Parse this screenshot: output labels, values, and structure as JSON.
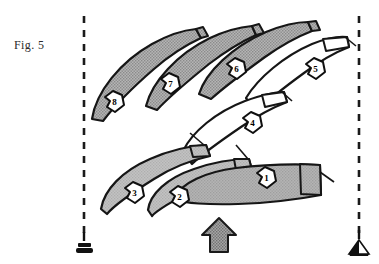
{
  "figure": {
    "label": "Fig. 5",
    "caption_position": "left"
  },
  "canvas": {
    "width": 379,
    "height": 264,
    "background_color": "#ffffff"
  },
  "colors": {
    "ink": "#1a1a1a",
    "hull_hatched_gray": "#9a9a9a",
    "hull_light_gray": "#b8b8b8",
    "hull_medium_gray": "#a8a8a8",
    "hull_white": "#ffffff",
    "arrow_gray": "#8c8c8c",
    "marker_black": "#111111"
  },
  "start_line": {
    "left_limit": {
      "name": "committee-boat-marker",
      "shape": "post-with-black-block",
      "x": 84,
      "y": 244
    },
    "right_limit": {
      "name": "pin-flag-marker",
      "shape": "post-with-half-filled-triangle",
      "x": 359,
      "y": 244
    },
    "left_layline": {
      "x": 84,
      "y_top": 16,
      "y_bottom": 234,
      "style": "dashed"
    },
    "right_layline": {
      "x": 359,
      "y_top": 16,
      "y_bottom": 234,
      "style": "dashed"
    }
  },
  "wind_arrow": {
    "name": "wind-direction-arrow",
    "direction": "up",
    "x": 219,
    "y": 240,
    "fill": "hatched-gray"
  },
  "boats": [
    {
      "number": "1",
      "fill": "medium-gray",
      "badge_x": 265,
      "badge_y": 177,
      "row": "bottom",
      "order": 1
    },
    {
      "number": "2",
      "fill": "light-gray",
      "badge_x": 178,
      "badge_y": 196,
      "row": "bottom",
      "order": 2
    },
    {
      "number": "3",
      "fill": "light-gray",
      "badge_x": 133,
      "badge_y": 192,
      "row": "bottom",
      "order": 3
    },
    {
      "number": "4",
      "fill": "white",
      "badge_x": 251,
      "badge_y": 123,
      "row": "middle",
      "order": 4
    },
    {
      "number": "5",
      "fill": "white",
      "badge_x": 314,
      "badge_y": 69,
      "row": "top",
      "order": 5
    },
    {
      "number": "6",
      "fill": "hatched-gray",
      "badge_x": 235,
      "badge_y": 69,
      "row": "top",
      "order": 6
    },
    {
      "number": "7",
      "fill": "hatched-gray",
      "badge_x": 169,
      "badge_y": 84,
      "row": "top",
      "order": 7
    },
    {
      "number": "8",
      "fill": "hatched-gray",
      "badge_x": 113,
      "badge_y": 102,
      "row": "top",
      "order": 8
    }
  ]
}
